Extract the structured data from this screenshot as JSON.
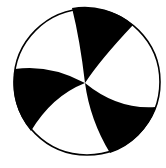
{
  "diagram": {
    "type": "focal-mechanism-beachball",
    "background": "#ffffff",
    "outline_color": "#000000",
    "fill_color": "#000000",
    "circle": {
      "cx": 87,
      "cy": 82,
      "r": 73
    },
    "center": {
      "x": 85,
      "y": 83
    },
    "blades": [
      {
        "name": "top-blade",
        "path": "M72,8 A73,73 0 0 1 133,25 Q100,60 85,83 Q80,40 72,8 Z"
      },
      {
        "name": "left-blade",
        "path": "M15,69 A73,73 0 0 0 31,131 Q52,96 85,83 Q50,64 15,69 Z"
      },
      {
        "name": "bottom-right-blade",
        "path": "M156,107 A73,73 0 0 1 110,153 Q90,120 85,83 Q118,110 156,107 Z"
      }
    ]
  }
}
